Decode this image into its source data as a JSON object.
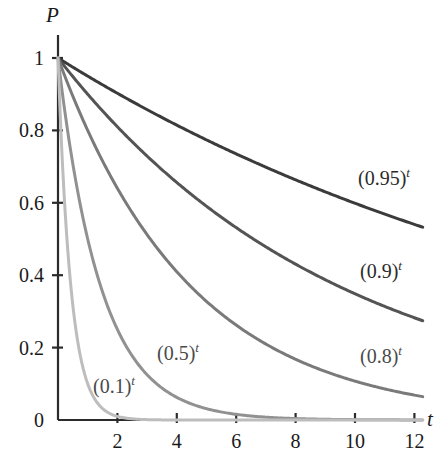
{
  "chart_data": {
    "type": "line",
    "title": "",
    "subtitle": "",
    "xlabel": "t",
    "ylabel": "P",
    "xlim": [
      0,
      12.9
    ],
    "ylim": [
      0,
      1.09
    ],
    "grid": false,
    "legend_position": "inline-annotations",
    "x_ticks": [
      2,
      4,
      6,
      8,
      10,
      12
    ],
    "x_tick_labels": [
      "2",
      "4",
      "6",
      "8",
      "10",
      "12"
    ],
    "y_ticks": [
      0,
      0.2,
      0.4,
      0.6,
      0.8,
      1
    ],
    "y_tick_labels": [
      "0",
      "0.2",
      "0.4",
      "0.6",
      "0.8",
      "1"
    ],
    "x": [
      0,
      0.5,
      1,
      1.5,
      2,
      2.5,
      3,
      3.5,
      4,
      4.5,
      5,
      5.5,
      6,
      6.5,
      7,
      7.5,
      8,
      8.5,
      9,
      9.5,
      10,
      10.5,
      11,
      11.5,
      12
    ],
    "series": [
      {
        "name": "(0.95)^t",
        "label": "(0.95)",
        "exponent": "t",
        "base": 0.95,
        "color": "#3b3b3b",
        "width": 3.0,
        "label_x": 358,
        "label_y": 168,
        "values": [
          1,
          0.9747,
          0.95,
          0.926,
          0.9025,
          0.8796,
          0.8574,
          0.8357,
          0.8145,
          0.7939,
          0.7738,
          0.7542,
          0.7351,
          0.7164,
          0.6983,
          0.6806,
          0.6634,
          0.6465,
          0.6302,
          0.6142,
          0.5987,
          0.5836,
          0.5688,
          0.5544,
          0.5404
        ]
      },
      {
        "name": "(0.9)^t",
        "label": "(0.9)",
        "exponent": "t",
        "base": 0.9,
        "color": "#545454",
        "width": 3.0,
        "label_x": 360,
        "label_y": 261,
        "values": [
          1,
          0.9487,
          0.9,
          0.8538,
          0.81,
          0.7684,
          0.729,
          0.6916,
          0.6561,
          0.6224,
          0.5905,
          0.5601,
          0.5314,
          0.5041,
          0.4783,
          0.4537,
          0.4305,
          0.4084,
          0.3874,
          0.3675,
          0.3487,
          0.3308,
          0.3138,
          0.2977,
          0.2824
        ]
      },
      {
        "name": "(0.8)^t",
        "label": "(0.8)",
        "exponent": "t",
        "base": 0.8,
        "color": "#7a7a7a",
        "width": 3.0,
        "label_x": 360,
        "label_y": 346,
        "values": [
          1,
          0.8944,
          0.8,
          0.7155,
          0.64,
          0.5724,
          0.512,
          0.4579,
          0.4096,
          0.3664,
          0.3277,
          0.2931,
          0.2621,
          0.2345,
          0.2097,
          0.1876,
          0.1678,
          0.1501,
          0.1342,
          0.1201,
          0.1074,
          0.0961,
          0.0859,
          0.0768,
          0.0687
        ]
      },
      {
        "name": "(0.5)^t",
        "label": "(0.5)",
        "exponent": "t",
        "base": 0.5,
        "color": "#919191",
        "width": 3.0,
        "label_x": 157,
        "label_y": 343,
        "values": [
          1,
          0.7071,
          0.5,
          0.3536,
          0.25,
          0.1768,
          0.125,
          0.0884,
          0.0625,
          0.0442,
          0.0313,
          0.0221,
          0.0156,
          0.011,
          0.0078,
          0.0055,
          0.0039,
          0.0028,
          0.002,
          0.0014,
          0.001,
          0.0007,
          0.0005,
          0.0003,
          0.0002
        ]
      },
      {
        "name": "(0.1)^t",
        "label": "(0.1)",
        "exponent": "t",
        "base": 0.1,
        "color": "#bdbdbd",
        "width": 3.0,
        "label_x": 93,
        "label_y": 376,
        "values": [
          1,
          0.3162,
          0.1,
          0.0316,
          0.01,
          0.0032,
          0.001,
          0.0003,
          0.0001,
          3e-05,
          1e-05,
          3e-06,
          1e-06,
          0,
          0,
          0,
          0,
          0,
          0,
          0,
          0,
          0,
          0,
          0,
          0
        ]
      }
    ]
  },
  "axes": {
    "y_title": "P",
    "x_title": "t",
    "axis_color": "#2b2b2b"
  }
}
